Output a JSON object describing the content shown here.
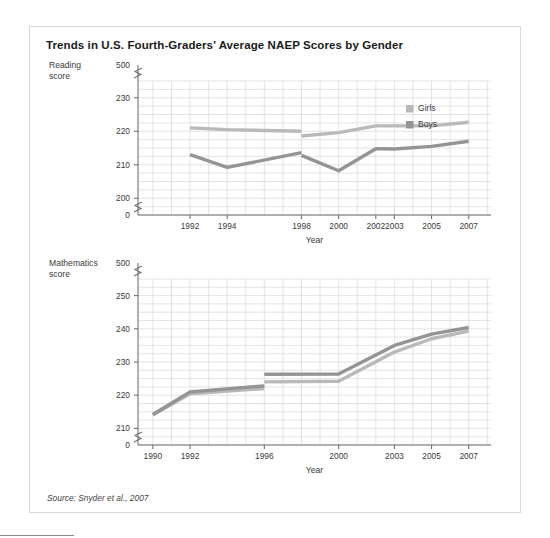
{
  "figure": {
    "title": "Trends in U.S. Fourth-Graders’ Average NAEP Scores by Gender",
    "source_note": "Source: Snyder et al., 2007",
    "background": "#ffffff",
    "border_color": "#d8d8d8",
    "grid_color": "#dcdcdc",
    "axis_color": "#6f6f6f",
    "text_color": "#3a3a3a"
  },
  "legend": {
    "position": "top-right-inside-reading-chart",
    "entries": [
      {
        "label": "Girls",
        "color": "#b9b9b9"
      },
      {
        "label": "Boys",
        "color": "#949494"
      }
    ]
  },
  "chart_data": [
    {
      "id": "reading",
      "type": "line",
      "title": "",
      "ylabel": "Reading\nscore",
      "xlabel": "Year",
      "axis_break": true,
      "axis_break_label_top": "500",
      "axis_break_label_bottom": "0",
      "ytick_labels": [
        "0",
        "200",
        "210",
        "220",
        "230",
        "500"
      ],
      "yticks": [
        200,
        210,
        220,
        230
      ],
      "ylim": [
        195,
        235
      ],
      "xticks": [
        1992,
        1994,
        1998,
        2000,
        2002,
        2003,
        2005,
        2007
      ],
      "xtick_labels": [
        "1992",
        "1994",
        "1998",
        "2000",
        "2002",
        "2003",
        "2005",
        "2007"
      ],
      "xlim": [
        1989.2,
        2008.2
      ],
      "grid": true,
      "grid_x_step": 1,
      "grid_y_step": 2.5,
      "series": [
        {
          "name": "Girls",
          "color": "#b9b9b9",
          "segments": [
            {
              "x": [
                1992,
                1994,
                1998
              ],
              "y": [
                221.0,
                220.5,
                220.0
              ]
            },
            {
              "x": [
                1998,
                2000,
                2002,
                2003,
                2005,
                2007
              ],
              "y": [
                218.6,
                219.6,
                221.6,
                221.6,
                221.6,
                222.7
              ]
            }
          ]
        },
        {
          "name": "Boys",
          "color": "#949494",
          "segments": [
            {
              "x": [
                1992,
                1994,
                1998
              ],
              "y": [
                213.0,
                209.2,
                213.6
              ]
            },
            {
              "x": [
                1998,
                2000,
                2002,
                2003,
                2005,
                2007
              ],
              "y": [
                212.8,
                208.2,
                214.8,
                214.7,
                215.5,
                217.0
              ]
            }
          ]
        }
      ]
    },
    {
      "id": "mathematics",
      "type": "line",
      "title": "",
      "ylabel": "Mathematics\nscore",
      "xlabel": "Year",
      "axis_break": true,
      "axis_break_label_top": "500",
      "axis_break_label_bottom": "0",
      "ytick_labels": [
        "0",
        "210",
        "220",
        "230",
        "240",
        "250",
        "500"
      ],
      "yticks": [
        210,
        220,
        230,
        240,
        250
      ],
      "ylim": [
        205,
        255
      ],
      "xticks": [
        1990,
        1992,
        1996,
        2000,
        2003,
        2005,
        2007
      ],
      "xtick_labels": [
        "1990",
        "1992",
        "1996",
        "2000",
        "2003",
        "2005",
        "2007"
      ],
      "xlim": [
        1989.2,
        2008.2
      ],
      "grid": true,
      "grid_x_step": 1,
      "grid_y_step": 2.5,
      "series": [
        {
          "name": "Girls",
          "color": "#b9b9b9",
          "segments": [
            {
              "x": [
                1990,
                1992,
                1996
              ],
              "y": [
                214.0,
                220.4,
                222.0
              ]
            },
            {
              "x": [
                1996,
                2000,
                2003,
                2005,
                2007
              ],
              "y": [
                224.0,
                224.2,
                233.0,
                237.0,
                239.3
              ]
            }
          ]
        },
        {
          "name": "Boys",
          "color": "#949494",
          "segments": [
            {
              "x": [
                1990,
                1992,
                1996
              ],
              "y": [
                214.2,
                221.0,
                222.8
              ]
            },
            {
              "x": [
                1996,
                2000,
                2003,
                2005,
                2007
              ],
              "y": [
                226.3,
                226.4,
                235.0,
                238.4,
                240.4
              ]
            }
          ]
        }
      ]
    }
  ]
}
